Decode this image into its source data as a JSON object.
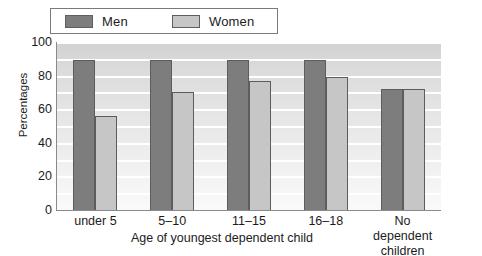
{
  "chart_data": {
    "type": "bar",
    "title": "",
    "xlabel": "Age of youngest dependent child",
    "ylabel": "Percentages",
    "categories": [
      "under 5",
      "5–10",
      "11–15",
      "16–18",
      "No dependent children"
    ],
    "series": [
      {
        "name": "Men",
        "values": [
          89,
          89,
          89,
          89,
          72
        ],
        "color": "#7d7d7d"
      },
      {
        "name": "Women",
        "values": [
          56,
          70,
          77,
          79,
          72
        ],
        "color": "#c6c6c6"
      }
    ],
    "ylim": [
      0,
      100
    ],
    "yticks": [
      0,
      20,
      40,
      60,
      80,
      100
    ],
    "ytick_labels": [
      "0",
      "20",
      "40",
      "60",
      "80",
      "100"
    ],
    "grid": true,
    "grid_axis": "y",
    "legend_position": "top"
  },
  "legend": {
    "entries": [
      {
        "label": "Men"
      },
      {
        "label": "Women"
      }
    ]
  },
  "axes": {
    "y_title": "Percentages",
    "x_title": "Age of youngest dependent child"
  },
  "xlabels": [
    {
      "line1": "under 5",
      "line2": ""
    },
    {
      "line1": "5–10",
      "line2": ""
    },
    {
      "line1": "11–15",
      "line2": ""
    },
    {
      "line1": "16–18",
      "line2": ""
    },
    {
      "line1": "No dependent",
      "line2": "children"
    }
  ]
}
